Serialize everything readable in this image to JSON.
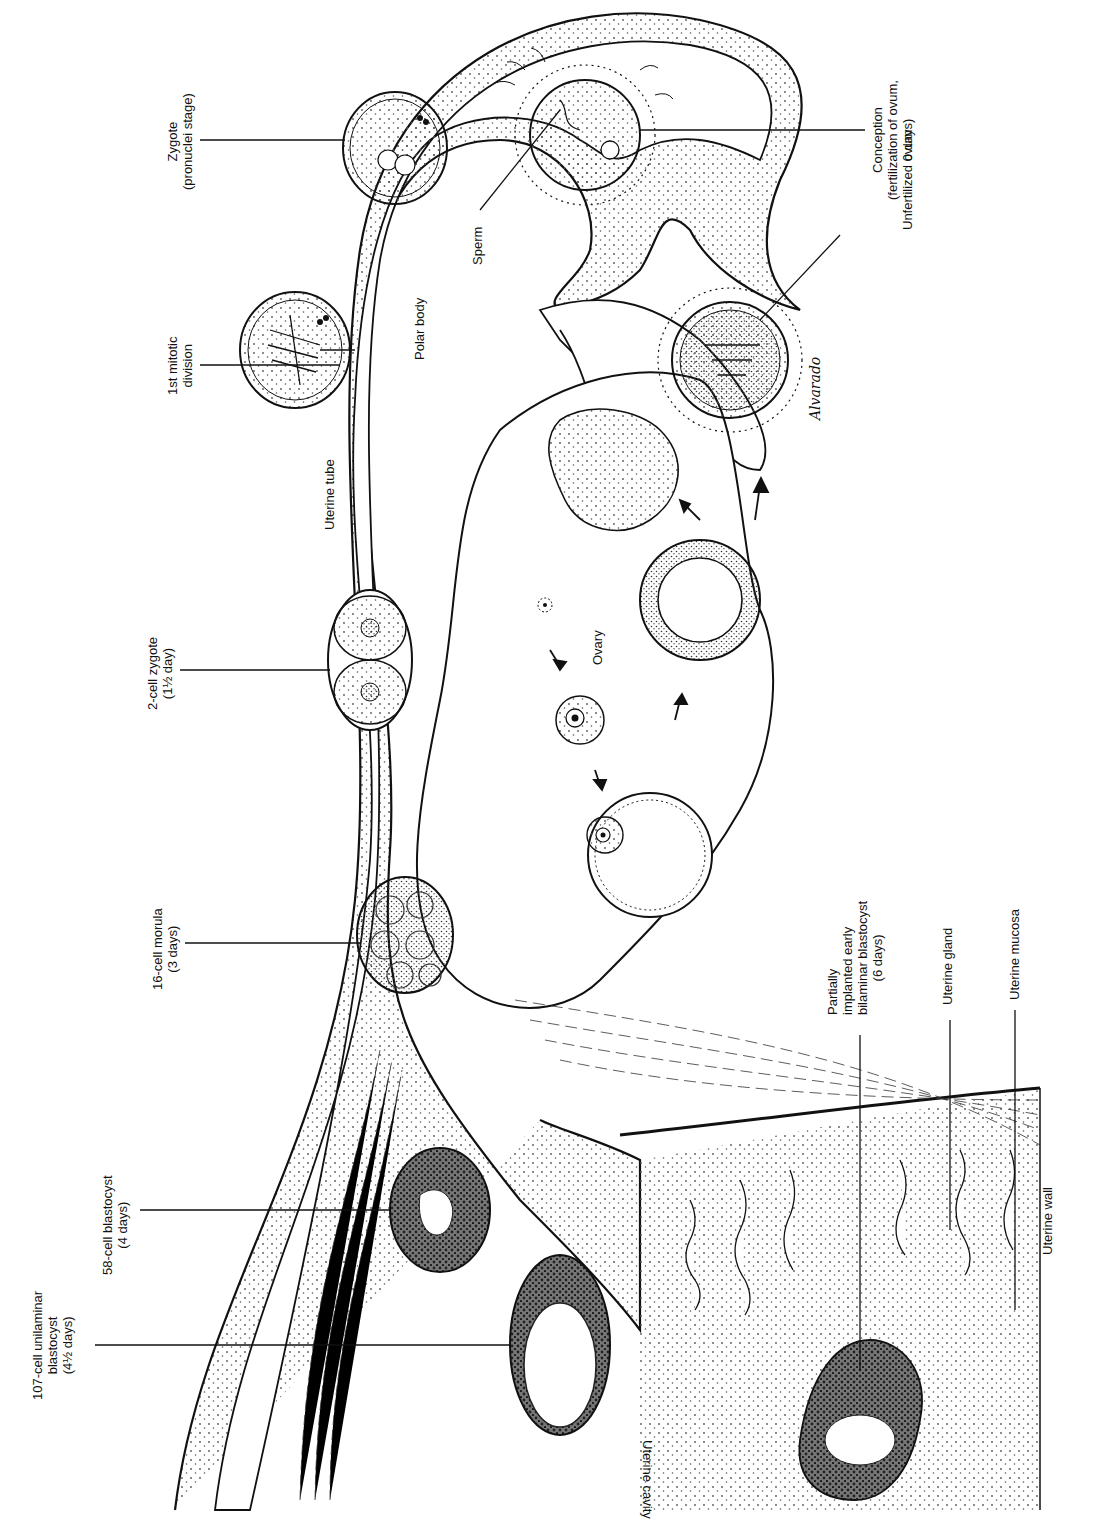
{
  "figure": {
    "style": "black-and-white stippled anatomical line drawing, rotated 90 degrees",
    "signature": "Alvarado"
  },
  "labels": {
    "zygote": {
      "line1": "Zygote",
      "line2": "(pronuclei stage)"
    },
    "first_mitotic": {
      "line1": "1st mitotic",
      "line2": "division"
    },
    "two_cell": {
      "line1": "2-cell zygote",
      "line2": "(1½ day)"
    },
    "sixteen_cell": {
      "line1": "16-cell morula",
      "line2": "(3 days)"
    },
    "fifty_eight_cell": {
      "line1": "58-cell blastocyst",
      "line2": "(4 days)"
    },
    "one_oh_seven_cell": {
      "line1": "107-cell unilaminar",
      "line2": "blastocyst",
      "line3": "(4½ days)"
    },
    "conception": {
      "line1": "Conception",
      "line2": "(fertilization of ovum,",
      "line3": "0 days)"
    },
    "unfertilized_ovum": "Unfertilized ovum",
    "sperm": "Sperm",
    "polar_body": "Polar body",
    "uterine_tube": "Uterine tube",
    "ovary": "Ovary",
    "partially_implanted": {
      "line1": "Partially",
      "line2": "implanted early",
      "line3": "bilaminar blastocyst",
      "line4": "(6 days)"
    },
    "uterine_gland": "Uterine gland",
    "uterine_mucosa": "Uterine mucosa",
    "uterine_wall": "Uterine wall",
    "uterine_cavity": "Uterine cavity"
  },
  "colors": {
    "ink": "#111111",
    "paper": "#ffffff",
    "stipple": "#555555",
    "dark_cell": "#2a2a2a"
  }
}
